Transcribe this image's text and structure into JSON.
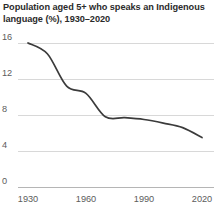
{
  "chart_data": {
    "type": "line",
    "title": "Population aged 5+ who speaks an Indigenous language (%), 1930–2020",
    "title_line1": "Population aged 5+ who speaks an Indigenous",
    "title_line2": "language (%), 1930–2020",
    "xlabel": "",
    "ylabel": "",
    "xlim": [
      1930,
      2020
    ],
    "ylim": [
      0,
      16
    ],
    "xticks": [
      1930,
      1960,
      1990,
      2020
    ],
    "xtick_labels": [
      "1930",
      "1960",
      "1990",
      "2020"
    ],
    "yticks": [
      0,
      4,
      8,
      12,
      16
    ],
    "ytick_labels": [
      "0",
      "4",
      "8",
      "12",
      "16"
    ],
    "grid": "horizontal",
    "legend": "none",
    "line_color": "#3b3b3b",
    "grid_color": "#d8d8d8",
    "axis_color": "#b5b5b5",
    "text_color": "#5c5c5c",
    "title_color": "#2b2b2b",
    "x": [
      1930,
      1940,
      1950,
      1960,
      1970,
      1980,
      1990,
      2000,
      2010,
      2020
    ],
    "values": [
      16.0,
      14.8,
      11.2,
      10.4,
      7.8,
      7.7,
      7.5,
      7.1,
      6.6,
      5.5
    ],
    "series": [
      {
        "name": "Population aged 5+ who speaks an Indigenous language (%)",
        "values": [
          16.0,
          14.8,
          11.2,
          10.4,
          7.8,
          7.7,
          7.5,
          7.1,
          6.6,
          5.5
        ]
      }
    ]
  }
}
